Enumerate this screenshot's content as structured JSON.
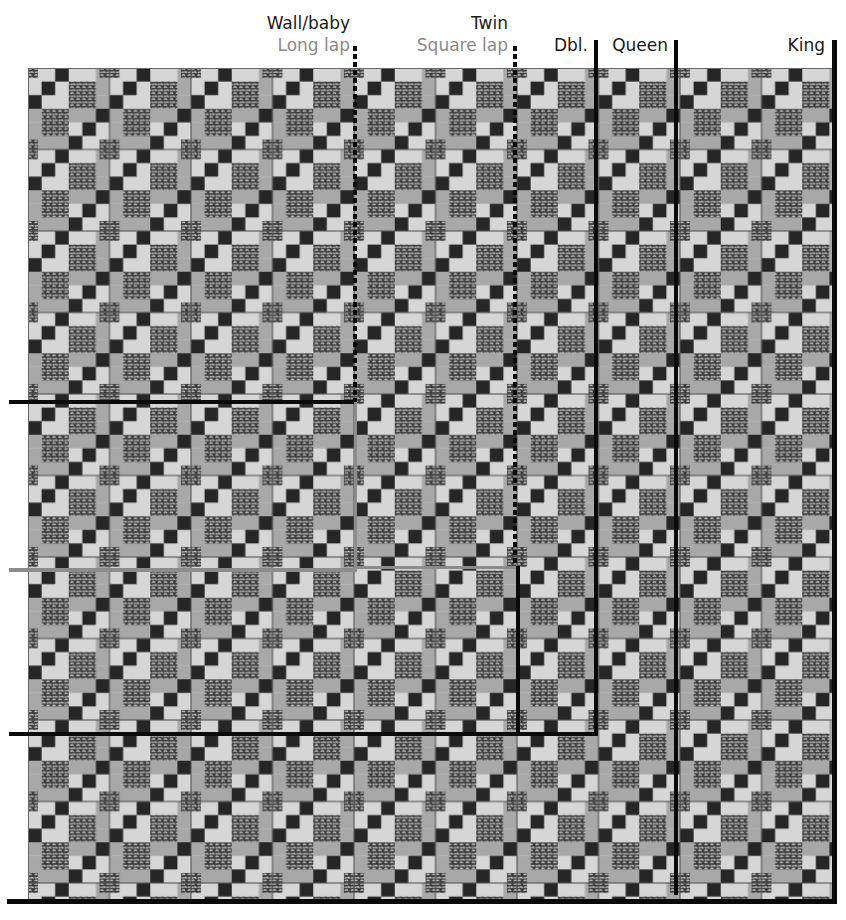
{
  "size_labels": {
    "wall_baby": "Wall/baby",
    "long_lap": "Long lap",
    "twin": "Twin",
    "square_lap": "Square lap",
    "double": "Dbl.",
    "queen": "Queen",
    "king": "King"
  },
  "colors": {
    "black_line": "#0a0a0a",
    "grey_line": "#8c8c8c",
    "dark_square": "#262626",
    "medium_grey": "#a8a8a8",
    "light_grey": "#d6d6d6",
    "print_bg": "#3a3a3a",
    "print_fg": "#e8e8e8"
  },
  "quilt": {
    "block_size_px": 81.5,
    "columns": 10,
    "rows": 10
  }
}
